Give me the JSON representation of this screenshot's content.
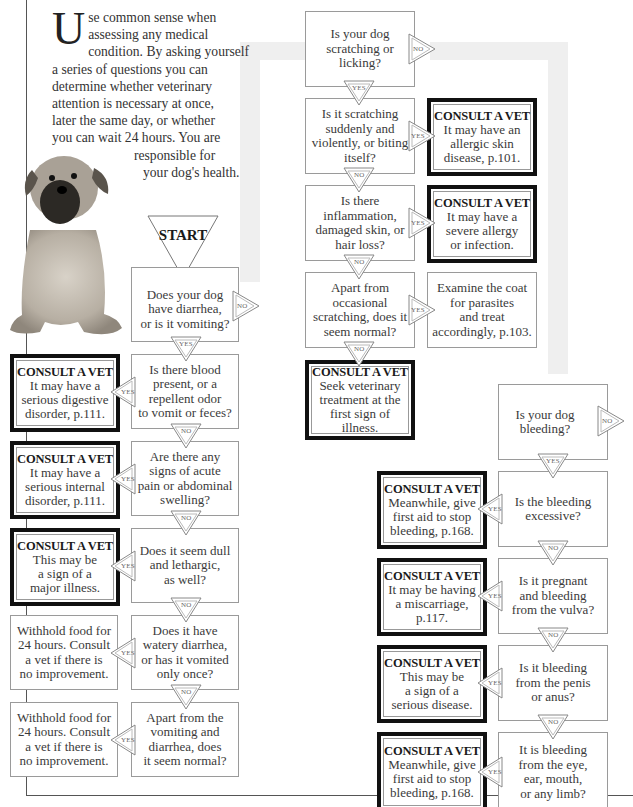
{
  "intro": {
    "dropcap": "U",
    "lines": [
      "se common sense when",
      "assessing any medical",
      "condition. By asking yourself",
      "a series of questions you can",
      "determine whether veterinary",
      "attention is necessary at once,",
      "later the same day, or whether",
      "you can wait 24 hours. You are"
    ],
    "tail1": "responsible for",
    "tail2": "your dog's health."
  },
  "start_label": "START",
  "labels": {
    "yes": "YES",
    "no": "NO"
  },
  "consult_heading": "CONSULT A VET",
  "digestive_flow": {
    "questions": [
      "Does your dog\nhave diarrhea,\nor is it vomiting?",
      "Is there blood\npresent, or a\nrepellent odor\nto vomit or feces?",
      "Are there any\nsigns of acute\npain or abdominal\nswelling?",
      "Does it seem dull\nand lethargic,\nas well?",
      "Does it have\nwatery diarrhea,\nor has it vomited\nonly once?",
      "Apart from the\nvomiting and\ndiarrhea, does\nit seem normal?"
    ],
    "outcomes": [
      {
        "type": "consult",
        "text": "It may have a\nserious digestive\ndisorder, p.111."
      },
      {
        "type": "consult",
        "text": "It may have a\nserious internal\ndisorder, p.111."
      },
      {
        "type": "consult",
        "text": "This may be\na sign of a\nmajor illness."
      },
      {
        "type": "plain",
        "text": "Withhold food for\n24 hours. Consult\na vet if there is\nno improvement."
      },
      {
        "type": "plain",
        "text": "Withhold food for\n24 hours. Consult\na vet if there is\nno improvement."
      }
    ]
  },
  "skin_flow": {
    "questions": [
      "Is your dog\nscratching or\nlicking?",
      "Is it scratching\nsuddenly and\nviolently, or biting\nitself?",
      "Is there\ninflammation,\ndamaged skin, or\nhair loss?",
      "Apart from\noccasional\nscratching, does it\nseem normal?"
    ],
    "outcomes": [
      {
        "type": "consult",
        "text": "It may have an\nallergic skin\ndisease, p.101."
      },
      {
        "type": "consult",
        "text": "It may have a\nsevere allergy\nor infection."
      },
      {
        "type": "plain",
        "text": "Examine the coat\nfor parasites\nand treat\naccordingly, p.103."
      },
      {
        "type": "consult",
        "text": "Seek veterinary\ntreatment at the\nfirst sign of illness."
      }
    ]
  },
  "bleeding_flow": {
    "questions": [
      "Is your dog\nbleeding?",
      "Is the bleeding\nexcessive?",
      "Is it pregnant\nand bleeding\nfrom the vulva?",
      "Is it bleeding\nfrom the penis\nor anus?",
      "It is bleeding\nfrom the eye,\near, mouth,\nor any limb?"
    ],
    "outcomes": [
      {
        "type": "consult",
        "text": "Meanwhile, give\nfirst aid to stop\nbleeding, p.168."
      },
      {
        "type": "consult",
        "text": "It may be having\na miscarriage,\np.117."
      },
      {
        "type": "consult",
        "text": "This may be\na sign of a\nserious disease."
      },
      {
        "type": "consult",
        "text": "Meanwhile, give\nfirst aid to stop\nbleeding, p.168."
      }
    ]
  },
  "colors": {
    "consult_border": "#111111",
    "box_border": "#9a9a9a",
    "connector_band": "#efefef",
    "text": "#3a3a3a"
  }
}
